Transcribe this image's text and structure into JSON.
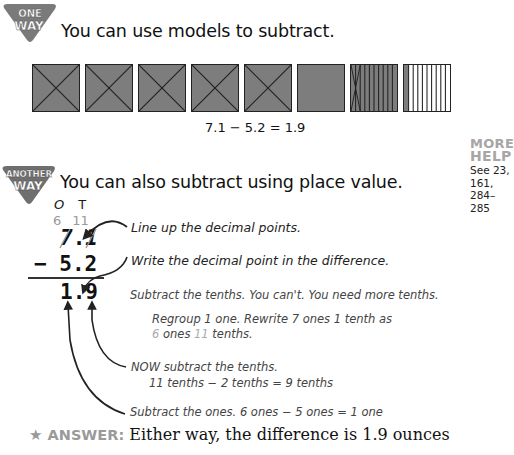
{
  "section_one": {
    "badge_line1": "ONE",
    "badge_line2": "WAY",
    "heading": "You can use models to subtract."
  },
  "model": {
    "squares": [
      {
        "type": "whole",
        "crossed": true
      },
      {
        "type": "whole",
        "crossed": true
      },
      {
        "type": "whole",
        "crossed": true
      },
      {
        "type": "whole",
        "crossed": true
      },
      {
        "type": "whole",
        "crossed": true
      },
      {
        "type": "whole",
        "crossed": false
      },
      {
        "type": "tenths",
        "shaded_strips": 10,
        "crossed_strips": 2
      },
      {
        "type": "tenths",
        "shaded_strips": 1,
        "crossed_strips": 0
      }
    ],
    "equation": "7.1 − 5.2 = 1.9",
    "shade_color": "#7d7d7d"
  },
  "more_help": {
    "title_line1": "MORE",
    "title_line2": "HELP",
    "see_line1": "See 23,",
    "see_line2": "161,",
    "see_line3": "284–285"
  },
  "section_two": {
    "badge_line1": "ANOTHER",
    "badge_line2": "WAY",
    "heading": "You can also subtract using place value.",
    "column_headers": {
      "ones": "O",
      "tenths": "T"
    },
    "regroup_values": {
      "ones": "6",
      "tenths": "11"
    },
    "minuend": "7.1",
    "minuend_ones": "7",
    "minuend_point": ".",
    "minuend_tenths": "1",
    "subtrahend_sign": "−",
    "subtrahend": "5.2",
    "difference": "1.9",
    "difference_ones": "1",
    "difference_point": ".",
    "difference_tenths": "9",
    "notes": {
      "line_up": "Line up the decimal points.",
      "write_point": "Write the decimal point in the difference.",
      "subtract_tenths_fail": "Subtract the tenths. You can't. You need more tenths.",
      "regroup_line1": "Regroup 1 one. Rewrite 7 ones 1 tenth as",
      "regroup_line2_a": "6",
      "regroup_line2_b": " ones ",
      "regroup_line2_c": "11",
      "regroup_line2_d": " tenths.",
      "now_subtract": "NOW subtract the tenths.",
      "tenths_equation": "11 tenths − 2 tenths = 9 tenths",
      "subtract_ones": "Subtract the ones. 6 ones − 5 ones = 1 one"
    }
  },
  "answer": {
    "star_icon": "★",
    "label": "ANSWER:",
    "text": "Either way, the difference is 1.9 ounces"
  }
}
